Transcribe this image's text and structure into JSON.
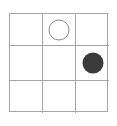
{
  "board": {
    "title": "3x3 grid with circle tokens",
    "rows": 3,
    "columns": 3,
    "border_color": "#a6a6a6",
    "gridline_color": "#a6a6a6",
    "background_color": "#ffffff",
    "cells": [
      {
        "id": "r1c1",
        "row": 1,
        "column": 1,
        "token": "empty",
        "token_label": ""
      },
      {
        "id": "r1c2",
        "row": 1,
        "column": 2,
        "token": "open-circle",
        "token_label": "open circle"
      },
      {
        "id": "r1c3",
        "row": 1,
        "column": 3,
        "token": "empty",
        "token_label": ""
      },
      {
        "id": "r2c1",
        "row": 2,
        "column": 1,
        "token": "empty",
        "token_label": ""
      },
      {
        "id": "r2c2",
        "row": 2,
        "column": 2,
        "token": "empty",
        "token_label": ""
      },
      {
        "id": "r2c3",
        "row": 2,
        "column": 3,
        "token": "filled-circle",
        "token_label": "filled circle"
      },
      {
        "id": "r3c1",
        "row": 3,
        "column": 1,
        "token": "empty",
        "token_label": ""
      },
      {
        "id": "r3c2",
        "row": 3,
        "column": 2,
        "token": "empty",
        "token_label": ""
      },
      {
        "id": "r3c3",
        "row": 3,
        "column": 3,
        "token": "empty",
        "token_label": ""
      }
    ],
    "tokens": {
      "open_circle": {
        "name": "open-circle-token",
        "fill": "#ffffff",
        "stroke": "#8a8a8a",
        "diameter_px": 21
      },
      "filled_circle": {
        "name": "filled-circle-token",
        "fill": "#3b3b3b",
        "stroke": "none",
        "diameter_px": 21
      }
    }
  }
}
